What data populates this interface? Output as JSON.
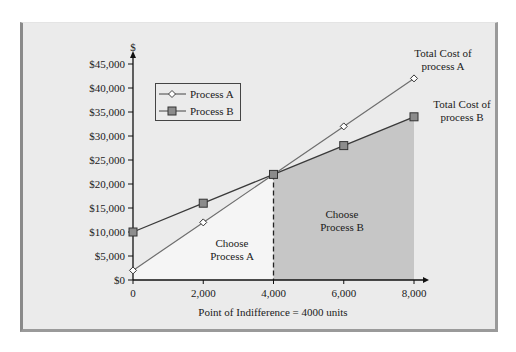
{
  "chart_data": {
    "type": "line",
    "title": "",
    "xlabel": "Point of Indifference = 4000 units",
    "ylabel": "$",
    "x": [
      0,
      2000,
      4000,
      6000,
      8000
    ],
    "x_tick_labels": [
      "0",
      "2,000",
      "4,000",
      "6,000",
      "8,000"
    ],
    "y_tick_labels": [
      "$0",
      "$5,000",
      "$10,000",
      "$15,000",
      "$20,000",
      "$25,000",
      "$30,000",
      "$35,000",
      "$40,000",
      "$45,000"
    ],
    "xlim": [
      0,
      8000
    ],
    "ylim": [
      0,
      45000
    ],
    "grid": false,
    "legend_position": "upper left",
    "series": [
      {
        "name": "Process A",
        "marker": "diamond",
        "values": [
          2000,
          12000,
          22000,
          32000,
          42000
        ]
      },
      {
        "name": "Process B",
        "marker": "square",
        "values": [
          10000,
          16000,
          22000,
          28000,
          34000
        ]
      }
    ],
    "annotations": [
      {
        "text": "Total Cost of process A",
        "x": 8000,
        "y": 42000
      },
      {
        "text": "Total Cost of process B",
        "x": 8000,
        "y": 34000
      },
      {
        "text": "Choose Process A",
        "region": [
          0,
          4000
        ]
      },
      {
        "text": "Choose Process B",
        "region": [
          4000,
          8000
        ]
      },
      {
        "text": "Point of Indifference = 4000 units",
        "x": 4000,
        "y": 22000
      }
    ],
    "indifference_point": {
      "x": 4000,
      "y": 22000
    }
  },
  "legend": {
    "a_label": "Process A",
    "b_label": "Process B"
  },
  "labels": {
    "y_unit": "$",
    "total_a_line1": "Total Cost of",
    "total_a_line2": "process A",
    "total_b_line1": "Total Cost of",
    "total_b_line2": "process B",
    "choose_a_line1": "Choose",
    "choose_a_line2": "Process A",
    "choose_b_line1": "Choose",
    "choose_b_line2": "Process B",
    "x_caption": "Point of Indifference = 4000 units"
  },
  "colors": {
    "background": "#ebebeb",
    "region_a": "#f5f5f5",
    "region_b": "#c6c6c6",
    "line_a": "#6e6e6e",
    "line_b": "#3a3a3a",
    "marker_b_fill": "#8c8c8c"
  }
}
